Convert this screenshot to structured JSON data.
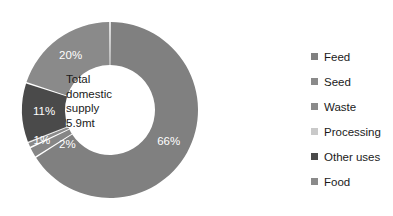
{
  "chart_data": {
    "type": "pie",
    "variant": "donut",
    "title": "",
    "subtitle": "",
    "xlabel": "",
    "ylabel": "",
    "grid": false,
    "legend_position": "right",
    "center_text": {
      "line1": "Total",
      "line2": "domestic",
      "line3": "supply",
      "line4": "5.9mt"
    },
    "total_label": "Total domestic supply 5.9mt",
    "total_value": "5.9mt",
    "units": "mt",
    "start_angle_deg": 0,
    "direction": "clockwise",
    "categories": [
      "Feed",
      "Seed",
      "Waste",
      "Processing",
      "Other uses",
      "Food"
    ],
    "values": [
      66,
      2,
      1,
      0,
      11,
      20
    ],
    "data_labels": [
      "66%",
      "2%",
      "1%",
      "0%",
      "11%",
      "20%"
    ],
    "colors": [
      "#808080",
      "#868686",
      "#8a8a8a",
      "#c9c9c9",
      "#4a4a4a",
      "#8a8a8a"
    ],
    "slices": [
      {
        "label": "Feed",
        "value": 66,
        "data_label": "66%",
        "color": "#808080"
      },
      {
        "label": "Seed",
        "value": 2,
        "data_label": "2%",
        "color": "#868686"
      },
      {
        "label": "Waste",
        "value": 1,
        "data_label": "1%",
        "color": "#8a8a8a"
      },
      {
        "label": "Processing",
        "value": 0,
        "data_label": "0%",
        "color": "#c9c9c9"
      },
      {
        "label": "Other uses",
        "value": 11,
        "data_label": "11%",
        "color": "#4a4a4a"
      },
      {
        "label": "Food",
        "value": 20,
        "data_label": "20%",
        "color": "#8a8a8a"
      }
    ]
  },
  "legend": {
    "items": [
      {
        "label": "Feed",
        "color": "#808080"
      },
      {
        "label": "Seed",
        "color": "#8a8a8a"
      },
      {
        "label": "Waste",
        "color": "#8a8a8a"
      },
      {
        "label": "Processing",
        "color": "#c9c9c9"
      },
      {
        "label": "Other uses",
        "color": "#4a4a4a"
      },
      {
        "label": "Food",
        "color": "#8a8a8a"
      }
    ]
  },
  "slice_labels": {
    "feed": "66%",
    "seed": "2%",
    "waste": "1%",
    "processing": "0%",
    "other_uses": "11%",
    "food": "20%"
  }
}
